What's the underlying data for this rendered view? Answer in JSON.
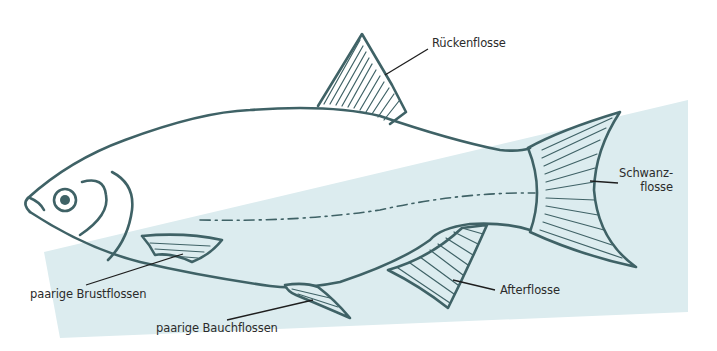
{
  "diagram": {
    "type": "labeled-illustration",
    "colors": {
      "background_panel": "#dcecef",
      "outline": "#3f6266",
      "label_text": "#2b2b2b",
      "leader_line": "#1e1e1e"
    },
    "labels": [
      {
        "id": "dorsal",
        "text": "Rückenflosse"
      },
      {
        "id": "caudal_line1",
        "text": "Schwanz-"
      },
      {
        "id": "caudal_line2",
        "text": "flosse"
      },
      {
        "id": "pectoral",
        "text": "paarige Brustflossen"
      },
      {
        "id": "pelvic",
        "text": "paarige Bauchflossen"
      },
      {
        "id": "anal",
        "text": "Afterflosse"
      }
    ]
  }
}
